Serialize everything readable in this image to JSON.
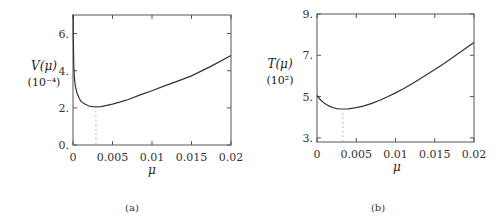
{
  "chart_data": [
    {
      "type": "line",
      "panel": "(a)",
      "caption": "(a)",
      "title": "",
      "xlabel": "μ",
      "ylabel": "V(μ)",
      "ylabel_unit": "(10⁻⁴)",
      "xlim": [
        0,
        0.02
      ],
      "ylim": [
        0,
        7
      ],
      "x_ticks": [
        0,
        0.005,
        0.01,
        0.015,
        0.02
      ],
      "x_tick_labels": [
        "0",
        "0.005",
        "0.01",
        "0.015",
        "0.02"
      ],
      "y_ticks": [
        0,
        2,
        4,
        6
      ],
      "y_tick_labels": [
        "0.",
        "2.",
        "4.",
        "6."
      ],
      "grid": false,
      "series": [
        {
          "name": "V(μ)",
          "x": [
            2e-05,
            5e-05,
            0.0001,
            0.0002,
            0.0003,
            0.0005,
            0.0008,
            0.001,
            0.0015,
            0.002,
            0.0025,
            0.0029,
            0.0035,
            0.004,
            0.005,
            0.006,
            0.007,
            0.0085,
            0.01,
            0.0115,
            0.013,
            0.015,
            0.0175,
            0.02
          ],
          "values": [
            7.0,
            5.6,
            4.2,
            3.5,
            3.15,
            2.8,
            2.5,
            2.35,
            2.2,
            2.1,
            2.06,
            2.05,
            2.07,
            2.11,
            2.2,
            2.32,
            2.45,
            2.7,
            2.92,
            3.17,
            3.4,
            3.72,
            4.25,
            4.82
          ]
        }
      ],
      "markers": [
        {
          "type": "vertical-dotted",
          "x": 0.0029,
          "y_from": 0,
          "y_to": 2.05,
          "label": "minimum"
        }
      ]
    },
    {
      "type": "line",
      "panel": "(b)",
      "caption": "(b)",
      "title": "",
      "xlabel": "μ",
      "ylabel": "T(μ)",
      "ylabel_unit": "(10²)",
      "xlim": [
        0,
        0.02
      ],
      "ylim": [
        2.8,
        9
      ],
      "x_ticks": [
        0,
        0.005,
        0.01,
        0.015,
        0.02
      ],
      "x_tick_labels": [
        "0",
        "0.005",
        "0.01",
        "0.015",
        "0.02"
      ],
      "y_ticks": [
        3,
        5,
        7,
        9
      ],
      "y_tick_labels": [
        "3.",
        "5.",
        "7.",
        "9."
      ],
      "grid": false,
      "series": [
        {
          "name": "T(μ)",
          "x": [
            0,
            0.0005,
            0.001,
            0.0015,
            0.002,
            0.0025,
            0.003,
            0.0033,
            0.004,
            0.005,
            0.006,
            0.007,
            0.008,
            0.009,
            0.01,
            0.011,
            0.012,
            0.013,
            0.014,
            0.015,
            0.016,
            0.017,
            0.018,
            0.019,
            0.02
          ],
          "values": [
            5.05,
            4.82,
            4.66,
            4.55,
            4.47,
            4.42,
            4.4,
            4.4,
            4.41,
            4.46,
            4.55,
            4.67,
            4.82,
            4.99,
            5.18,
            5.38,
            5.6,
            5.83,
            6.07,
            6.31,
            6.56,
            6.82,
            7.08,
            7.35,
            7.62
          ]
        }
      ],
      "markers": [
        {
          "type": "vertical-dotted",
          "x": 0.0033,
          "y_from": 2.8,
          "y_to": 4.4,
          "label": "minimum"
        }
      ]
    }
  ]
}
